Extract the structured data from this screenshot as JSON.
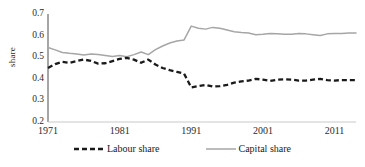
{
  "chart_data": {
    "type": "line",
    "title": "",
    "subtitle": "",
    "xlabel": "",
    "ylabel": "share",
    "xlim": [
      1971,
      2014
    ],
    "ylim": [
      0.2,
      0.7
    ],
    "grid": false,
    "legend_position": "bottom",
    "y_ticks": [
      "0.7",
      "0.6",
      "0.5",
      "0.4",
      "0.3",
      "0.2"
    ],
    "y_tick_values": [
      0.7,
      0.6,
      0.5,
      0.4,
      0.3,
      0.2
    ],
    "x_ticks": [
      "1971",
      "1981",
      "1991",
      "2001",
      "2011"
    ],
    "x_tick_values": [
      1971,
      1981,
      1991,
      2001,
      2011
    ],
    "x": [
      1971,
      1972,
      1973,
      1974,
      1975,
      1976,
      1977,
      1978,
      1979,
      1980,
      1981,
      1982,
      1983,
      1984,
      1985,
      1986,
      1987,
      1988,
      1989,
      1990,
      1991,
      1992,
      1993,
      1994,
      1995,
      1996,
      1997,
      1998,
      1999,
      2000,
      2001,
      2002,
      2003,
      2004,
      2005,
      2006,
      2007,
      2008,
      2009,
      2010,
      2011,
      2012,
      2013,
      2014
    ],
    "series": [
      {
        "name": "Labour share",
        "color": "#1a1a1a",
        "style": "dashed",
        "values": [
          0.45,
          0.468,
          0.479,
          0.474,
          0.482,
          0.489,
          0.483,
          0.47,
          0.472,
          0.482,
          0.492,
          0.497,
          0.489,
          0.474,
          0.489,
          0.466,
          0.45,
          0.44,
          0.432,
          0.424,
          0.36,
          0.366,
          0.372,
          0.364,
          0.366,
          0.372,
          0.382,
          0.388,
          0.392,
          0.4,
          0.396,
          0.39,
          0.396,
          0.398,
          0.396,
          0.392,
          0.392,
          0.396,
          0.4,
          0.394,
          0.392,
          0.394,
          0.394,
          0.394
        ]
      },
      {
        "name": "Capital share",
        "color": "#a6a6a6",
        "style": "solid",
        "values": [
          0.545,
          0.534,
          0.522,
          0.518,
          0.515,
          0.51,
          0.515,
          0.512,
          0.508,
          0.503,
          0.508,
          0.502,
          0.512,
          0.524,
          0.512,
          0.535,
          0.552,
          0.566,
          0.575,
          0.58,
          0.644,
          0.634,
          0.63,
          0.638,
          0.634,
          0.626,
          0.618,
          0.614,
          0.612,
          0.604,
          0.606,
          0.61,
          0.608,
          0.606,
          0.606,
          0.61,
          0.608,
          0.604,
          0.6,
          0.608,
          0.61,
          0.61,
          0.612,
          0.612
        ]
      }
    ]
  },
  "legend": {
    "items": [
      {
        "label": "Labour share"
      },
      {
        "label": "Capital share"
      }
    ]
  }
}
